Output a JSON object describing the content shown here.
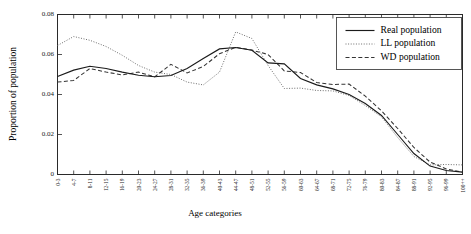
{
  "chart_data": {
    "type": "line",
    "title": "",
    "xlabel": "Age categories",
    "ylabel": "Proportion of population",
    "ylim": [
      0,
      0.08
    ],
    "yticks": [
      0,
      0.02,
      0.04,
      0.06,
      0.08
    ],
    "ytick_labels": [
      "0",
      "0.02",
      "0.04",
      "0.06",
      "0.08"
    ],
    "grid": false,
    "legend_position": "top-right",
    "categories": [
      "0-3",
      "4-7",
      "8-11",
      "12-15",
      "16-19",
      "20-23",
      "24-27",
      "28-31",
      "32-35",
      "36-39",
      "40-43",
      "44-47",
      "48-51",
      "52-55",
      "56-59",
      "60-63",
      "64-67",
      "68-71",
      "72-75",
      "76-79",
      "80-83",
      "84-87",
      "88-91",
      "92-95",
      "96-99",
      "100++"
    ],
    "series": [
      {
        "name": "Real population",
        "style": "solid",
        "color": "#1b1b1b",
        "values": [
          0.049,
          0.0522,
          0.0541,
          0.053,
          0.0512,
          0.0496,
          0.0489,
          0.0495,
          0.053,
          0.058,
          0.0628,
          0.0635,
          0.0621,
          0.0558,
          0.0553,
          0.048,
          0.0448,
          0.0428,
          0.04,
          0.0355,
          0.0295,
          0.02,
          0.0105,
          0.0042,
          0.002,
          0.0012
        ]
      },
      {
        "name": "LL population",
        "style": "dotted",
        "color": "#6e6e6e",
        "values": [
          0.0645,
          0.069,
          0.0671,
          0.064,
          0.0596,
          0.0545,
          0.0512,
          0.05,
          0.0462,
          0.0448,
          0.0512,
          0.0713,
          0.068,
          0.0545,
          0.043,
          0.0432,
          0.042,
          0.0418,
          0.0395,
          0.0345,
          0.0288,
          0.0185,
          0.009,
          0.0048,
          0.005,
          0.0048
        ]
      },
      {
        "name": "WD population",
        "style": "dashed",
        "color": "#343434",
        "values": [
          0.0462,
          0.047,
          0.053,
          0.0512,
          0.0498,
          0.0512,
          0.0488,
          0.0551,
          0.0508,
          0.054,
          0.0604,
          0.0636,
          0.0622,
          0.06,
          0.0518,
          0.051,
          0.046,
          0.045,
          0.0452,
          0.0392,
          0.0318,
          0.023,
          0.0135,
          0.0062,
          0.0028,
          0.0012
        ]
      }
    ]
  },
  "legend": {
    "items": [
      {
        "label": "Real population"
      },
      {
        "label": "LL population"
      },
      {
        "label": "WD population"
      }
    ]
  }
}
